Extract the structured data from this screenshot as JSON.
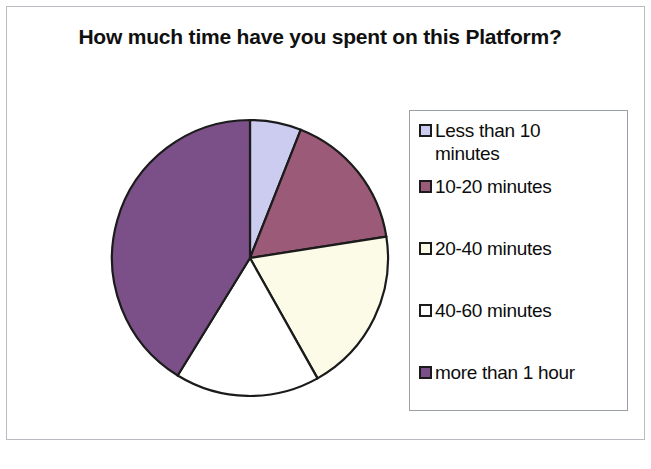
{
  "chart_data": {
    "type": "pie",
    "title": "How much time have you spent on this Platform?",
    "categories": [
      "Less than 10 minutes",
      "10-20 minutes",
      "20-40 minutes",
      "40-60 minutes",
      "more than 1 hour"
    ],
    "values": [
      6,
      16.5,
      19.3,
      17,
      41.2
    ],
    "units": "percent",
    "colors": [
      "#ccccf0",
      "#9b5a77",
      "#fcfbe8",
      "#ffffff",
      "#7b4f87"
    ],
    "start_angle_deg": 0,
    "direction": "clockwise",
    "legend_position": "right",
    "grid": false,
    "slice_angles_deg": [
      {
        "label": "Less than 10 minutes",
        "start": 0,
        "end": 21.6
      },
      {
        "label": "10-20 minutes",
        "start": 21.6,
        "end": 81.1
      },
      {
        "label": "20-40 minutes",
        "start": 81.1,
        "end": 150.7
      },
      {
        "label": "40-60 minutes",
        "start": 150.7,
        "end": 211.6
      },
      {
        "label": "more than 1 hour",
        "start": 211.6,
        "end": 360
      }
    ],
    "xlabel": "",
    "ylabel": ""
  },
  "title": {
    "text": "How much time have you spent on this Platform?"
  },
  "legend": {
    "items": [
      {
        "label": "Less than 10\nminutes",
        "color": "#ccccf0"
      },
      {
        "label": "10-20 minutes",
        "color": "#9b5a77"
      },
      {
        "label": "20-40 minutes",
        "color": "#fcfbe8"
      },
      {
        "label": "40-60 minutes",
        "color": "#ffffff"
      },
      {
        "label": "more than 1 hour",
        "color": "#7b4f87"
      }
    ]
  },
  "style": {
    "slice_outline": "#1b1b1b",
    "frame_border": "#b9bcc2",
    "legend_border": "#9aa0a8",
    "text_color": "#0d0d0d",
    "background": "#ffffff"
  }
}
